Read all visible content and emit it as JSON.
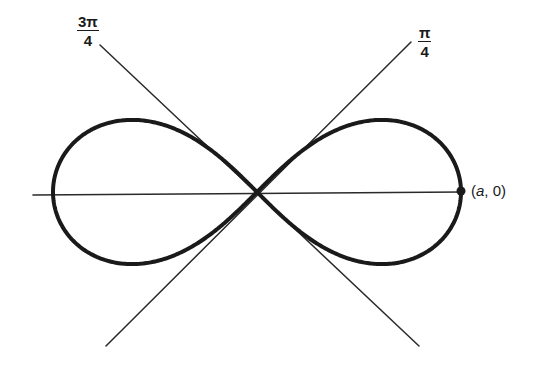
{
  "figure": {
    "curve": {
      "type": "lemniscate",
      "equation": "r^2 = a^2 cos 2θ",
      "center_px": [
        257,
        192
      ],
      "a_px": 204,
      "stroke_color": "#1a1a1a",
      "stroke_width": 4
    },
    "axis": {
      "x1": 33,
      "y1": 195,
      "x2": 462,
      "y2": 192,
      "color": "#2a2a2a",
      "width": 1.6
    },
    "lines": [
      {
        "name": "tangent-line-pi-over-4",
        "x1": 411,
        "y1": 42,
        "x2": 106,
        "y2": 346
      },
      {
        "name": "tangent-line-3pi-over-4",
        "x1": 100,
        "y1": 45,
        "x2": 419,
        "y2": 346
      }
    ],
    "labels": {
      "angle_3pi_4": {
        "numerator": "3π",
        "denominator": "4"
      },
      "angle_pi_4": {
        "numerator": "π",
        "denominator": "4"
      },
      "point": {
        "open": "(",
        "var": "a",
        "rest": ", 0)"
      }
    },
    "point": {
      "x": 461,
      "y": 191,
      "r": 4.5
    }
  }
}
